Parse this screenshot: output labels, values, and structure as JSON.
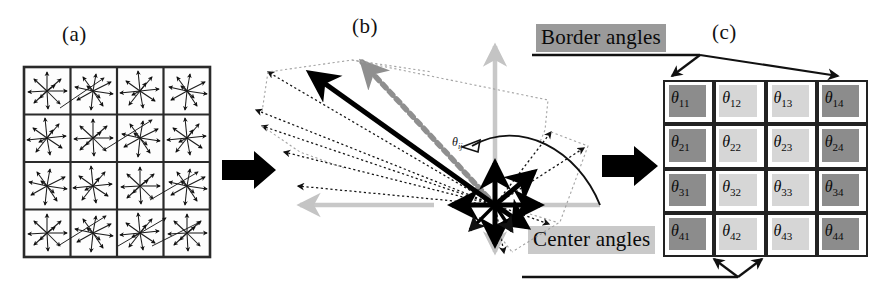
{
  "figure": {
    "panels": [
      {
        "id": "a",
        "label": "(a)",
        "caption": "gradient orientation star grid"
      },
      {
        "id": "b",
        "label": "(b)",
        "caption": "superimposed orientation vectors"
      },
      {
        "id": "c",
        "label": "(c)",
        "caption": "angle matrix"
      }
    ]
  },
  "panel_a": {
    "label": "(a)",
    "rows": 4,
    "cols": 4,
    "cell_icon": "arrow-star-icon"
  },
  "panel_b": {
    "label": "(b)",
    "angle_label": "θ",
    "angle_sub": "ij",
    "axis_color": "#c8c8c8",
    "vector_color": "#000000",
    "dotted_color": "#111111",
    "gray_vector_color": "#8f8f8f"
  },
  "panel_c": {
    "label": "(c)",
    "border_label": "Border angles",
    "center_label": "Center angles",
    "border_highlight": "#9a9a9a",
    "center_highlight": "#c9c9c9",
    "dark_cell": "#8c8c8c",
    "light_cell": "#d6d6d6",
    "grid": [
      [
        {
          "sym": "θ",
          "sub": "11",
          "shade": "dark"
        },
        {
          "sym": "θ",
          "sub": "12",
          "shade": "light"
        },
        {
          "sym": "θ",
          "sub": "13",
          "shade": "light"
        },
        {
          "sym": "θ",
          "sub": "14",
          "shade": "dark"
        }
      ],
      [
        {
          "sym": "θ",
          "sub": "21",
          "shade": "dark"
        },
        {
          "sym": "θ",
          "sub": "22",
          "shade": "light"
        },
        {
          "sym": "θ",
          "sub": "23",
          "shade": "light"
        },
        {
          "sym": "θ",
          "sub": "24",
          "shade": "dark"
        }
      ],
      [
        {
          "sym": "θ",
          "sub": "31",
          "shade": "dark"
        },
        {
          "sym": "θ",
          "sub": "32",
          "shade": "light"
        },
        {
          "sym": "θ",
          "sub": "33",
          "shade": "light"
        },
        {
          "sym": "θ",
          "sub": "34",
          "shade": "dark"
        }
      ],
      [
        {
          "sym": "θ",
          "sub": "41",
          "shade": "dark"
        },
        {
          "sym": "θ",
          "sub": "42",
          "shade": "light"
        },
        {
          "sym": "θ",
          "sub": "43",
          "shade": "light"
        },
        {
          "sym": "θ",
          "sub": "44",
          "shade": "dark"
        }
      ]
    ]
  },
  "flow": {
    "arrow1": "black-right-arrow",
    "arrow2": "black-right-arrow"
  }
}
